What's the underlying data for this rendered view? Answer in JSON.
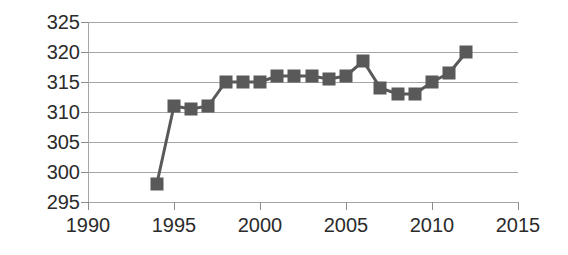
{
  "chart_data": {
    "type": "line",
    "title": "",
    "subtitle": "",
    "xlabel": "",
    "ylabel": "",
    "xlim": [
      1990,
      2015
    ],
    "ylim": [
      295,
      325
    ],
    "xticks": [
      1990,
      1995,
      2000,
      2005,
      2010,
      2015
    ],
    "yticks": [
      295,
      300,
      305,
      310,
      315,
      320,
      325
    ],
    "grid": true,
    "legend": false,
    "legend_position": "none",
    "marker": "square",
    "series": [
      {
        "name": "series-1",
        "color": "#595959",
        "x": [
          1994,
          1995,
          1996,
          1997,
          1998,
          1999,
          2000,
          2001,
          2002,
          2003,
          2004,
          2005,
          2006,
          2007,
          2008,
          2009,
          2010,
          2011,
          2012
        ],
        "values": [
          298,
          311,
          310.5,
          311,
          315,
          315,
          315,
          316,
          316,
          316,
          315.5,
          316,
          318.5,
          314,
          313,
          313,
          315,
          316.5,
          320
        ]
      }
    ]
  },
  "axes": {
    "y_tick_labels": [
      "325",
      "320",
      "315",
      "310",
      "305",
      "300",
      "295"
    ],
    "x_tick_labels": [
      "1990",
      "1995",
      "2000",
      "2005",
      "2010",
      "2015"
    ]
  },
  "colors": {
    "marker": "#595959",
    "line": "#595959",
    "grid": "#a6a6a6",
    "axis": "#8c8c8c",
    "text": "#2b2b2b",
    "background": "#ffffff"
  }
}
